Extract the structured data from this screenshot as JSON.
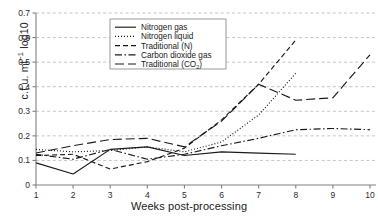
{
  "chart_data": {
    "type": "line",
    "title": "",
    "xlabel": "Weeks post-processing",
    "ylabel": "c.f.u. ml⁻¹ log10",
    "ylabel_main": "c.f.u. ml",
    "ylabel_sup": "−1",
    "ylabel_tail": " log10",
    "x": [
      1,
      2,
      3,
      4,
      5,
      6,
      7,
      8,
      9,
      10
    ],
    "xlim": [
      1,
      10
    ],
    "ylim": [
      0,
      0.7
    ],
    "xticks": [
      "1",
      "2",
      "3",
      "4",
      "5",
      "6",
      "7",
      "8",
      "9",
      "10"
    ],
    "yticks": [
      "0",
      "0.1",
      "0.2",
      "0.3",
      "0.4",
      "0.5",
      "0.6",
      "0.7"
    ],
    "ytick_values": [
      0,
      0.1,
      0.2,
      0.3,
      0.4,
      0.5,
      0.6,
      0.7
    ],
    "grid": true,
    "grid_style": "dashed-horizontal",
    "legend_position": "top-center",
    "line_color": "#1a1a1a",
    "grid_color": "#aaaaaa",
    "axis_color": "#808080",
    "series": [
      {
        "name": "Nitrogen gas",
        "style": "solid",
        "dash": "",
        "x": [
          1,
          2,
          3,
          4,
          5,
          6,
          7,
          8
        ],
        "values": [
          0.09,
          0.045,
          0.145,
          0.155,
          0.12,
          0.135,
          0.13,
          0.125
        ]
      },
      {
        "name": "Nitrogen liquid",
        "style": "dotted",
        "dash": "1,2",
        "x": [
          1,
          2,
          3,
          4,
          5,
          6,
          7,
          8
        ],
        "values": [
          0.145,
          0.135,
          0.14,
          0.155,
          0.135,
          0.175,
          0.285,
          0.455
        ]
      },
      {
        "name": "Traditional (N)",
        "style": "dash-short",
        "dash": "5,3",
        "x": [
          1,
          2,
          3,
          4,
          5,
          6,
          7,
          8
        ],
        "values": [
          0.12,
          0.125,
          0.065,
          0.095,
          0.15,
          0.265,
          0.41,
          0.59
        ]
      },
      {
        "name": "Carbon dioxide gas",
        "style": "dash-dot",
        "dash": "7,2.5,1.5,2.5",
        "x": [
          1,
          2,
          3,
          4,
          5,
          6,
          7,
          8,
          9,
          10
        ],
        "values": [
          0.125,
          0.105,
          0.145,
          0.105,
          0.125,
          0.16,
          0.19,
          0.225,
          0.23,
          0.225
        ]
      },
      {
        "name": "Traditional (CO₂)",
        "style": "dash-long",
        "dash": "9,4",
        "x": [
          1,
          2,
          3,
          4,
          5,
          6,
          7,
          8,
          9,
          10
        ],
        "values": [
          0.13,
          0.16,
          0.185,
          0.19,
          0.155,
          0.26,
          0.41,
          0.345,
          0.355,
          0.53
        ]
      }
    ],
    "legend_entries": [
      {
        "label": "Nitrogen gas",
        "label_main": "Nitrogen gas",
        "label_sub": "",
        "label_end": "",
        "dash": ""
      },
      {
        "label": "Nitrogen liquid",
        "label_main": "Nitrogen liquid",
        "label_sub": "",
        "label_end": "",
        "dash": "1,2"
      },
      {
        "label": "Traditional (N)",
        "label_main": "Traditional (N)",
        "label_sub": "",
        "label_end": "",
        "dash": "5,3"
      },
      {
        "label": "Carbon dioxide gas",
        "label_main": "Carbon dioxide gas",
        "label_sub": "",
        "label_end": "",
        "dash": "7,2.5,1.5,2.5"
      },
      {
        "label": "Traditional (CO₂)",
        "label_main": "Traditional (CO",
        "label_sub": "2",
        "label_end": ")",
        "dash": "9,4"
      }
    ]
  }
}
